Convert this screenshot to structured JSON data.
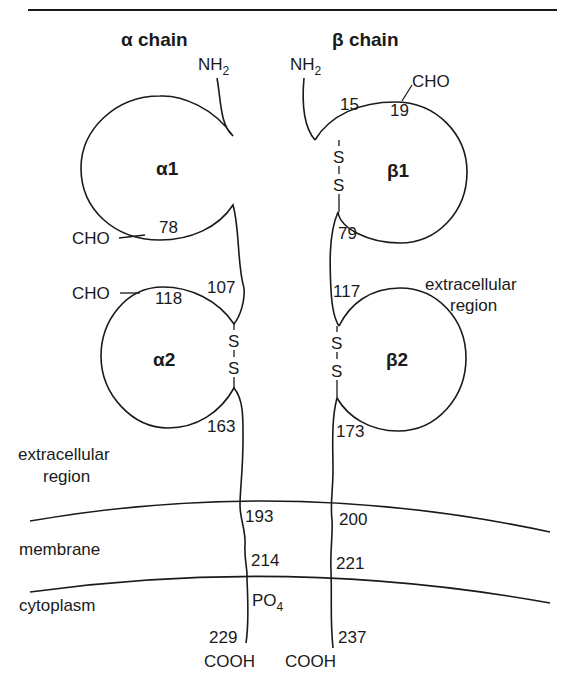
{
  "figure": {
    "top_rule": true,
    "chains": {
      "alpha": {
        "title": "α chain",
        "n_terminus": {
          "base": "NH",
          "sub": "2"
        },
        "c_terminus": "COOH",
        "domains": [
          {
            "label": "α1",
            "residues": [
              "78"
            ],
            "glycosylation": "CHO"
          },
          {
            "label": "α2",
            "residues": [
              "107",
              "118",
              "163"
            ],
            "glycosylation": "CHO"
          }
        ],
        "disulfide": [
          "S",
          "S"
        ],
        "membrane_residues": [
          "193",
          "214"
        ],
        "phosphorylation": {
          "base": "PO",
          "sub": "4"
        },
        "c_terminal_residue": "229"
      },
      "beta": {
        "title": "β chain",
        "n_terminus": {
          "base": "NH",
          "sub": "2"
        },
        "c_terminus": "COOH",
        "domains": [
          {
            "label": "β1",
            "residues": [
              "15",
              "19",
              "79"
            ],
            "glycosylation": "CHO"
          },
          {
            "label": "β2",
            "residues": [
              "117",
              "173"
            ]
          }
        ],
        "disulfide_1": [
          "S",
          "S"
        ],
        "disulfide_2": [
          "S",
          "S"
        ],
        "membrane_residues": [
          "200",
          "221"
        ],
        "c_terminal_residue": "237"
      }
    },
    "regions": {
      "extracellular_right": [
        "extracellular",
        "region"
      ],
      "extracellular_left": [
        "extracellular",
        "region"
      ],
      "membrane": "membrane",
      "cytoplasm": "cytoplasm"
    }
  }
}
